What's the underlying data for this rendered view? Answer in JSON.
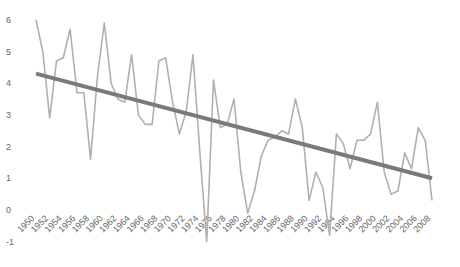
{
  "chart_data": {
    "type": "line",
    "title": "",
    "xlabel": "",
    "ylabel": "",
    "ylim": [
      -1,
      6
    ],
    "grid": false,
    "legend": null,
    "yticks": [
      6,
      5,
      4,
      3,
      2,
      1,
      0,
      -1
    ],
    "xtick_labels": [
      "1950",
      "1952",
      "1954",
      "1956",
      "1958",
      "1960",
      "1962",
      "1964",
      "1966",
      "1968",
      "1970",
      "1972",
      "1974",
      "1976",
      "1978",
      "1980",
      "1982",
      "1984",
      "1986",
      "1988",
      "1990",
      "1992",
      "1994",
      "1996",
      "1998",
      "2000",
      "2002",
      "2004",
      "2006",
      "2008"
    ],
    "x": [
      1950,
      1951,
      1952,
      1953,
      1954,
      1955,
      1956,
      1957,
      1958,
      1959,
      1960,
      1961,
      1962,
      1963,
      1964,
      1965,
      1966,
      1967,
      1968,
      1969,
      1970,
      1971,
      1972,
      1973,
      1974,
      1975,
      1976,
      1977,
      1978,
      1979,
      1980,
      1981,
      1982,
      1983,
      1984,
      1985,
      1986,
      1987,
      1988,
      1989,
      1990,
      1991,
      1992,
      1993,
      1994,
      1995,
      1996,
      1997,
      1998,
      1999,
      2000,
      2001,
      2002,
      2003,
      2004,
      2005,
      2006,
      2007,
      2008
    ],
    "series": [
      {
        "name": "values",
        "color": "#b0b0b0",
        "values": [
          6.0,
          5.0,
          2.9,
          4.7,
          4.8,
          5.7,
          3.7,
          3.7,
          1.6,
          4.2,
          5.9,
          4.0,
          3.5,
          3.4,
          4.9,
          3.0,
          2.7,
          2.7,
          4.7,
          4.8,
          3.4,
          2.4,
          3.1,
          4.9,
          1.8,
          -1.0,
          4.1,
          2.6,
          2.7,
          3.5,
          1.2,
          -0.1,
          0.6,
          1.7,
          2.2,
          2.3,
          2.5,
          2.4,
          3.5,
          2.6,
          0.3,
          1.2,
          0.7,
          -0.8,
          2.4,
          2.1,
          1.3,
          2.2,
          2.2,
          2.4,
          3.4,
          1.2,
          0.5,
          0.6,
          1.8,
          1.3,
          2.6,
          2.2,
          0.3
        ]
      },
      {
        "name": "trend",
        "color": "#7a7a7a",
        "x": [
          1950,
          2008
        ],
        "values": [
          4.3,
          1.0
        ]
      }
    ]
  }
}
